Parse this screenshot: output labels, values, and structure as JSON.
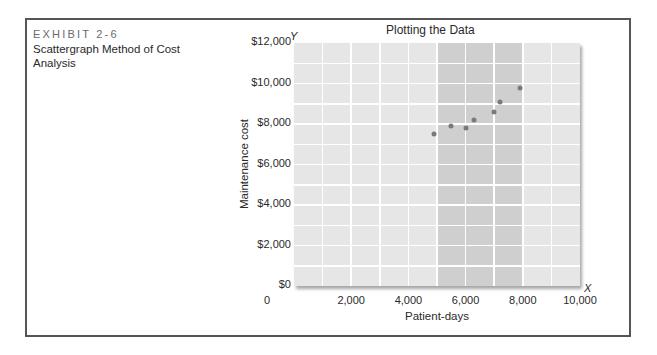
{
  "exhibit": {
    "label": "EXHIBIT 2-6",
    "title": "Scattergraph Method of Cost Analysis"
  },
  "colors": {
    "plot_background": "#e6e6e6",
    "shaded_band": "#cfcfcf",
    "gridlines": "#ffffff",
    "points": "#7a7a7a",
    "frame_border": "#555555"
  },
  "chart_data": {
    "type": "scatter",
    "title": "Plotting the Data",
    "xlabel": "Patient-days",
    "ylabel": "Maintenance cost",
    "x_axis_letter": "X",
    "y_axis_letter": "Y",
    "xlim": [
      0,
      10000
    ],
    "ylim": [
      0,
      12000
    ],
    "x_ticks": [
      0,
      2000,
      4000,
      6000,
      8000,
      10000
    ],
    "x_tick_labels": [
      "0",
      "2,000",
      "4,000",
      "6,000",
      "8,000",
      "10,000"
    ],
    "y_ticks": [
      0,
      2000,
      4000,
      6000,
      8000,
      10000,
      12000
    ],
    "y_tick_labels": [
      "$0",
      "$2,000",
      "$4,000",
      "$6,000",
      "$8,000",
      "$10,000",
      "$12,000"
    ],
    "grid": true,
    "grid_x_step": 1000,
    "grid_y_step": 1000,
    "shaded_x_range": [
      5000,
      8000
    ],
    "legend": null,
    "points": [
      {
        "x": 4900,
        "y": 7500
      },
      {
        "x": 5500,
        "y": 7900
      },
      {
        "x": 6000,
        "y": 7800
      },
      {
        "x": 6300,
        "y": 8200
      },
      {
        "x": 7000,
        "y": 8600
      },
      {
        "x": 7200,
        "y": 9100
      },
      {
        "x": 7900,
        "y": 9800
      }
    ]
  }
}
